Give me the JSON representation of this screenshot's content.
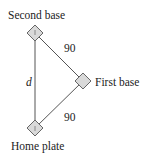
{
  "diagram": {
    "labels": {
      "second_base": "Second base",
      "first_base": "First base",
      "home_plate": "Home plate",
      "side_top": "90",
      "side_bottom": "90",
      "diagonal": "d"
    },
    "colors": {
      "line": "#555555",
      "base_fill": "#d9d9d9",
      "base_stroke": "#666666",
      "text": "#222222"
    }
  }
}
